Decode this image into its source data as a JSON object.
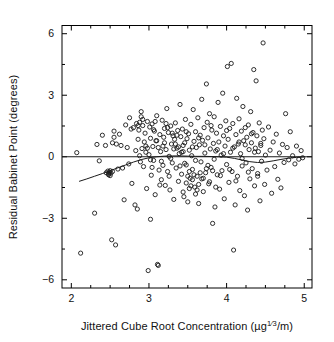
{
  "figure": {
    "background": "#ffffff",
    "frame_color": "#000000",
    "point_color": "#1a1a1a",
    "line_color": "#1a1a1a"
  },
  "axes": {
    "x": {
      "label_prefix": "Jittered Cube Root Concentration (",
      "label_unit_base": "µg",
      "label_unit_sup_num": "1",
      "label_unit_sup_den": "3",
      "label_suffix": "/m)",
      "label_full": "Jittered Cube Root Concentration (µg⅓/m)",
      "ticks": [
        2,
        3,
        4,
        5
      ],
      "tick_labels": [
        "2",
        "3",
        "4",
        "5"
      ],
      "minor_ticks": [
        2.25,
        2.5,
        2.75,
        3.25,
        3.5,
        3.75,
        4.25,
        4.5,
        4.75
      ],
      "range": [
        1.88,
        5.1
      ]
    },
    "y": {
      "label": "Residual Babinet Point (degrees)",
      "ticks": [
        6,
        3,
        0,
        -3,
        -6
      ],
      "tick_labels": [
        "6",
        "3",
        "0",
        "−3",
        "−6"
      ],
      "minor_ticks": [
        4.5,
        1.5,
        -1.5,
        -4.5
      ],
      "range": [
        -6.4,
        6.4
      ]
    }
  },
  "chart_data": {
    "type": "scatter",
    "title": "",
    "xlabel": "Jittered Cube Root Concentration (µg⅓/m)",
    "ylabel": "Residual Babinet Point (degrees)",
    "xlim": [
      1.88,
      5.1
    ],
    "ylim": [
      -6.4,
      6.4
    ],
    "grid": false,
    "legend": "none",
    "marker": "open-circle",
    "marker_size_px": 4.2,
    "reference_line": {
      "type": "horizontal",
      "y": 0,
      "label": "zero residual line"
    },
    "smoother": {
      "name": "lowess",
      "type": "line",
      "x": [
        2.1,
        2.2,
        2.3,
        2.4,
        2.5,
        2.6,
        2.7,
        2.8,
        2.9,
        3.0,
        3.1,
        3.2,
        3.3,
        3.4,
        3.5,
        3.6,
        3.7,
        3.8,
        3.9,
        4.0,
        4.1,
        4.2,
        4.3,
        4.4,
        4.5,
        4.6,
        4.7,
        4.8,
        4.9,
        5.0
      ],
      "y": [
        -1.2,
        -1.08,
        -0.95,
        -0.82,
        -0.68,
        -0.54,
        -0.4,
        -0.26,
        -0.14,
        -0.05,
        0.0,
        0.03,
        0.04,
        0.04,
        0.03,
        0.02,
        0.02,
        0.01,
        0.0,
        -0.02,
        -0.08,
        -0.16,
        -0.24,
        -0.28,
        -0.26,
        -0.2,
        -0.13,
        -0.07,
        -0.03,
        -0.01
      ]
    },
    "points": [
      [
        2.07,
        0.2
      ],
      [
        2.12,
        -4.7
      ],
      [
        2.3,
        -2.75
      ],
      [
        2.33,
        0.6
      ],
      [
        2.36,
        -0.2
      ],
      [
        2.4,
        1.05
      ],
      [
        2.44,
        0.55
      ],
      [
        2.45,
        -0.78
      ],
      [
        2.47,
        -0.7
      ],
      [
        2.48,
        -0.82
      ],
      [
        2.49,
        -0.75
      ],
      [
        2.5,
        -0.68
      ],
      [
        2.51,
        -0.8
      ],
      [
        2.52,
        -4.05
      ],
      [
        2.53,
        0.68
      ],
      [
        2.55,
        1.25
      ],
      [
        2.55,
        0.95
      ],
      [
        2.57,
        -4.3
      ],
      [
        2.58,
        0.62
      ],
      [
        2.6,
        -0.6
      ],
      [
        2.62,
        1.1
      ],
      [
        2.64,
        0.55
      ],
      [
        2.66,
        -0.55
      ],
      [
        2.68,
        -2.1
      ],
      [
        2.7,
        1.55
      ],
      [
        2.72,
        0.45
      ],
      [
        2.74,
        -0.35
      ],
      [
        2.75,
        1.9
      ],
      [
        2.77,
        1.35
      ],
      [
        2.78,
        -1.3
      ],
      [
        2.8,
        1.42
      ],
      [
        2.82,
        -2.35
      ],
      [
        2.83,
        0.3
      ],
      [
        2.84,
        1.62
      ],
      [
        2.85,
        -2.55
      ],
      [
        2.86,
        0.85
      ],
      [
        2.87,
        1.3
      ],
      [
        2.88,
        0.05
      ],
      [
        2.89,
        -0.25
      ],
      [
        2.9,
        1.95
      ],
      [
        2.9,
        2.2
      ],
      [
        2.91,
        0.4
      ],
      [
        2.92,
        1.52
      ],
      [
        2.93,
        -0.48
      ],
      [
        2.94,
        0.72
      ],
      [
        2.95,
        1.15
      ],
      [
        2.96,
        0.22
      ],
      [
        2.97,
        -1.55
      ],
      [
        2.98,
        1.72
      ],
      [
        2.99,
        -5.55
      ],
      [
        3.0,
        0.1
      ],
      [
        3.01,
        1.45
      ],
      [
        3.02,
        -3.05
      ],
      [
        3.02,
        0.9
      ],
      [
        3.03,
        -0.9
      ],
      [
        3.04,
        1.6
      ],
      [
        3.05,
        0.5
      ],
      [
        3.06,
        -0.18
      ],
      [
        3.07,
        1.25
      ],
      [
        3.08,
        -1.85
      ],
      [
        3.09,
        0.78
      ],
      [
        3.1,
        2.0
      ],
      [
        3.11,
        -5.25
      ],
      [
        3.12,
        -5.3
      ],
      [
        3.13,
        -0.65
      ],
      [
        3.14,
        1.08
      ],
      [
        3.15,
        0.25
      ],
      [
        3.16,
        -1.12
      ],
      [
        3.17,
        1.78
      ],
      [
        3.18,
        -0.42
      ],
      [
        3.19,
        0.95
      ],
      [
        3.2,
        1.38
      ],
      [
        3.21,
        -1.4
      ],
      [
        3.22,
        0.35
      ],
      [
        3.23,
        2.35
      ],
      [
        3.24,
        -0.72
      ],
      [
        3.25,
        1.18
      ],
      [
        3.26,
        0.02
      ],
      [
        3.27,
        -1.62
      ],
      [
        3.28,
        1.5
      ],
      [
        3.29,
        0.62
      ],
      [
        3.3,
        -0.3
      ],
      [
        3.31,
        1.02
      ],
      [
        3.32,
        -2.08
      ],
      [
        3.33,
        0.85
      ],
      [
        3.34,
        1.65
      ],
      [
        3.35,
        -0.55
      ],
      [
        3.36,
        0.42
      ],
      [
        3.37,
        1.28
      ],
      [
        3.38,
        -1.2
      ],
      [
        3.39,
        0.15
      ],
      [
        3.4,
        2.55
      ],
      [
        3.41,
        0.98
      ],
      [
        3.42,
        -0.85
      ],
      [
        3.43,
        1.35
      ],
      [
        3.44,
        0.55
      ],
      [
        3.45,
        -1.95
      ],
      [
        3.46,
        0.68
      ],
      [
        3.47,
        1.82
      ],
      [
        3.48,
        -0.4
      ],
      [
        3.49,
        0.88
      ],
      [
        3.5,
        -2.2
      ],
      [
        3.51,
        1.12
      ],
      [
        3.52,
        0.32
      ],
      [
        3.53,
        -1.05
      ],
      [
        3.54,
        1.58
      ],
      [
        3.55,
        0.05
      ],
      [
        3.56,
        -0.62
      ],
      [
        3.57,
        2.3
      ],
      [
        3.58,
        0.75
      ],
      [
        3.59,
        -1.48
      ],
      [
        3.6,
        1.22
      ],
      [
        3.61,
        0.45
      ],
      [
        3.62,
        -0.95
      ],
      [
        3.63,
        1.9
      ],
      [
        3.64,
        -2.28
      ],
      [
        3.65,
        0.58
      ],
      [
        3.66,
        1.05
      ],
      [
        3.67,
        -0.25
      ],
      [
        3.68,
        2.8
      ],
      [
        3.69,
        0.8
      ],
      [
        3.7,
        -1.7
      ],
      [
        3.71,
        1.42
      ],
      [
        3.72,
        0.18
      ],
      [
        3.73,
        -0.78
      ],
      [
        3.74,
        3.55
      ],
      [
        3.75,
        1.68
      ],
      [
        3.76,
        0.92
      ],
      [
        3.77,
        -1.32
      ],
      [
        3.78,
        2.1
      ],
      [
        3.79,
        0.38
      ],
      [
        3.8,
        -0.52
      ],
      [
        3.81,
        1.3
      ],
      [
        3.82,
        -3.25
      ],
      [
        3.83,
        0.65
      ],
      [
        3.84,
        1.95
      ],
      [
        3.85,
        -2.45
      ],
      [
        3.86,
        0.28
      ],
      [
        3.87,
        1.15
      ],
      [
        3.88,
        -0.88
      ],
      [
        3.89,
        2.65
      ],
      [
        3.9,
        0.72
      ],
      [
        3.91,
        -1.58
      ],
      [
        3.92,
        1.48
      ],
      [
        3.93,
        0.08
      ],
      [
        3.94,
        -0.68
      ],
      [
        3.95,
        3.1
      ],
      [
        3.96,
        1.02
      ],
      [
        3.97,
        -2.05
      ],
      [
        3.98,
        0.52
      ],
      [
        3.99,
        1.75
      ],
      [
        4.0,
        -0.38
      ],
      [
        4.01,
        4.4
      ],
      [
        4.02,
        0.85
      ],
      [
        4.03,
        -1.25
      ],
      [
        4.04,
        1.38
      ],
      [
        4.05,
        0.22
      ],
      [
        4.06,
        4.55
      ],
      [
        4.07,
        -0.72
      ],
      [
        4.08,
        1.62
      ],
      [
        4.09,
        -4.55
      ],
      [
        4.1,
        0.48
      ],
      [
        4.11,
        -2.35
      ],
      [
        4.12,
        1.08
      ],
      [
        4.13,
        2.85
      ],
      [
        4.14,
        -0.95
      ],
      [
        4.15,
        0.62
      ],
      [
        4.16,
        1.85
      ],
      [
        4.17,
        -1.65
      ],
      [
        4.18,
        0.15
      ],
      [
        4.19,
        1.25
      ],
      [
        4.2,
        -0.45
      ],
      [
        4.21,
        2.45
      ],
      [
        4.22,
        0.78
      ],
      [
        4.23,
        -1.9
      ],
      [
        4.24,
        1.42
      ],
      [
        4.25,
        -0.3
      ],
      [
        4.26,
        0.95
      ],
      [
        4.27,
        -2.6
      ],
      [
        4.28,
        1.55
      ],
      [
        4.29,
        0.35
      ],
      [
        4.3,
        -1.08
      ],
      [
        4.31,
        2.2
      ],
      [
        4.32,
        0.68
      ],
      [
        4.33,
        -0.58
      ],
      [
        4.34,
        1.18
      ],
      [
        4.35,
        4.25
      ],
      [
        4.36,
        -1.42
      ],
      [
        4.37,
        0.42
      ],
      [
        4.38,
        3.7
      ],
      [
        4.39,
        1.02
      ],
      [
        4.4,
        -0.82
      ],
      [
        4.41,
        0.25
      ],
      [
        4.42,
        1.65
      ],
      [
        4.43,
        -2.15
      ],
      [
        4.44,
        0.55
      ],
      [
        4.45,
        -0.22
      ],
      [
        4.46,
        1.3
      ],
      [
        4.47,
        5.55
      ],
      [
        4.48,
        0.88
      ],
      [
        4.49,
        -1.35
      ],
      [
        4.5,
        0.08
      ],
      [
        4.52,
        -0.65
      ],
      [
        4.54,
        1.45
      ],
      [
        4.56,
        0.32
      ],
      [
        4.58,
        -1.78
      ],
      [
        4.6,
        0.72
      ],
      [
        4.62,
        -0.48
      ],
      [
        4.64,
        1.1
      ],
      [
        4.66,
        -1.1
      ],
      [
        4.68,
        0.18
      ],
      [
        4.7,
        -1.52
      ],
      [
        4.72,
        0.6
      ],
      [
        4.74,
        -0.28
      ],
      [
        4.76,
        2.1
      ],
      [
        4.78,
        0.45
      ],
      [
        4.8,
        -0.15
      ],
      [
        4.82,
        1.22
      ],
      [
        4.85,
        0.05
      ],
      [
        4.88,
        -0.35
      ],
      [
        4.9,
        0.52
      ],
      [
        4.93,
        -0.12
      ],
      [
        4.96,
        0.3
      ],
      [
        4.98,
        -0.05
      ],
      [
        2.86,
        1.52
      ],
      [
        2.88,
        1.68
      ],
      [
        2.92,
        1.82
      ],
      [
        2.96,
        0.52
      ],
      [
        3.04,
        -0.52
      ],
      [
        3.08,
        1.72
      ],
      [
        3.12,
        0.45
      ],
      [
        3.16,
        -0.22
      ],
      [
        3.2,
        0.68
      ],
      [
        3.24,
        1.42
      ],
      [
        3.28,
        -0.08
      ],
      [
        3.32,
        0.38
      ],
      [
        3.36,
        1.05
      ],
      [
        3.4,
        -0.45
      ],
      [
        3.44,
        0.25
      ],
      [
        3.48,
        1.22
      ],
      [
        3.52,
        -0.72
      ],
      [
        3.56,
        0.48
      ],
      [
        3.6,
        -0.18
      ],
      [
        3.64,
        0.92
      ],
      [
        3.68,
        -1.08
      ],
      [
        3.72,
        0.58
      ],
      [
        3.76,
        -0.42
      ],
      [
        3.8,
        1.52
      ],
      [
        3.84,
        -0.12
      ],
      [
        3.88,
        0.35
      ],
      [
        3.92,
        -0.92
      ],
      [
        3.96,
        0.15
      ],
      [
        4.0,
        1.28
      ],
      [
        4.04,
        -0.62
      ],
      [
        4.08,
        0.42
      ],
      [
        4.12,
        -1.18
      ],
      [
        4.16,
        0.72
      ],
      [
        4.2,
        -0.08
      ],
      [
        4.24,
        0.58
      ],
      [
        4.28,
        -0.75
      ],
      [
        4.32,
        1.12
      ],
      [
        4.36,
        0.22
      ],
      [
        4.4,
        -0.95
      ],
      [
        4.44,
        0.65
      ],
      [
        2.48,
        -0.88
      ],
      [
        2.5,
        -0.92
      ],
      [
        2.53,
        -0.72
      ],
      [
        3.38,
        0.48
      ],
      [
        3.42,
        0.22
      ],
      [
        3.46,
        -0.32
      ],
      [
        3.34,
        0.62
      ],
      [
        3.3,
        1.15
      ],
      [
        3.26,
        -0.95
      ],
      [
        3.22,
        1.62
      ],
      [
        3.18,
        0.52
      ],
      [
        3.14,
        -1.38
      ],
      [
        3.1,
        0.78
      ],
      [
        3.06,
        1.32
      ],
      [
        3.02,
        -0.15
      ],
      [
        2.98,
        0.42
      ],
      [
        3.44,
        -1.72
      ],
      [
        3.48,
        -1.28
      ],
      [
        3.52,
        -1.55
      ],
      [
        3.56,
        -1.12
      ],
      [
        3.6,
        -1.82
      ],
      [
        3.64,
        -1.35
      ],
      [
        3.5,
        -0.95
      ],
      [
        3.54,
        -1.42
      ],
      [
        3.58,
        -0.88
      ],
      [
        3.62,
        -1.62
      ],
      [
        3.66,
        -0.78
      ],
      [
        3.7,
        -1.05
      ],
      [
        3.74,
        -0.58
      ],
      [
        3.78,
        -1.22
      ],
      [
        3.82,
        -0.68
      ],
      [
        3.86,
        -1.48
      ]
    ]
  }
}
